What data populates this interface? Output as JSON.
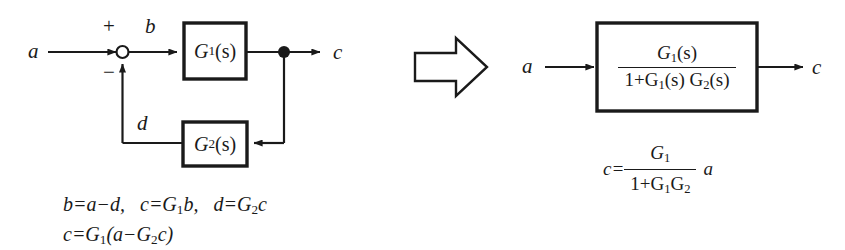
{
  "figure": {
    "type": "block-diagram",
    "background_color": "#ffffff",
    "stroke_color": "#1a1a1a"
  },
  "left_diagram": {
    "name": "feedback-loop-diagram",
    "input_label": "a",
    "error_label": "b",
    "feedback_label": "d",
    "output_label": "c",
    "plus_sign": "+",
    "minus_sign": "−",
    "forward_block": {
      "label_base": "G",
      "label_sub": "1",
      "label_arg": "(s)",
      "text": "G₁(s)"
    },
    "feedback_block": {
      "label_base": "G",
      "label_sub": "2",
      "label_arg": "(s)",
      "text": "G₂(s)"
    },
    "summing_junction": "open-circle",
    "takeoff_point": "filled-dot"
  },
  "equations_left": {
    "line1_parts": {
      "eq1": "b=a−d,",
      "eq2_lhs": "c=G",
      "eq2_sub": "1",
      "eq2_rhs": "b,",
      "eq3_lhs": "d=G",
      "eq3_sub": "2",
      "eq3_rhs": "c"
    },
    "line2_parts": {
      "lhs": "c=G",
      "sub1": "1",
      "mid": "(a−G",
      "sub2": "2",
      "rhs": "c)"
    },
    "line1_text": "b=a−d,  c=G₁b,  d=G₂c",
    "line2_text": "c=G₁(a−G₂c)"
  },
  "implication_arrow": {
    "name": "implies-arrow",
    "direction": "right",
    "style": "hollow-outline-block-arrow"
  },
  "right_diagram": {
    "name": "reduced-block-diagram",
    "input_label": "a",
    "output_label": "c",
    "block_transfer_function": {
      "numerator_base": "G",
      "numerator_sub": "1",
      "numerator_arg": "(s)",
      "numerator_text": "G₁(s)",
      "denominator_prefix": "1+G",
      "denominator_sub1": "1",
      "denominator_mid": "(s) G",
      "denominator_sub2": "2",
      "denominator_suffix": "(s)",
      "denominator_text": "1+G₁(s) G₂(s)"
    }
  },
  "equation_right": {
    "lhs": "c=",
    "numerator_base": "G",
    "numerator_sub": "1",
    "numerator_text": "G₁",
    "denominator_prefix": "1+G",
    "denominator_sub1": "1",
    "denominator_mid": "G",
    "denominator_sub2": "2",
    "denominator_text": "1+G₁G₂",
    "trailing_variable": "a",
    "full_text": "c= G₁/(1+G₁G₂) a"
  }
}
